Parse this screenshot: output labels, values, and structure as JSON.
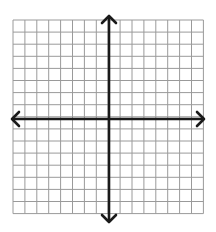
{
  "diagram": {
    "type": "coordinate-plane",
    "grid": {
      "columns": 16,
      "rows": 16,
      "left": 13,
      "top": 20,
      "cell_width": 11.9,
      "cell_height": 12.1,
      "line_color": "#9a9a9a"
    },
    "axes": {
      "color": "#1a1a1a",
      "x_axis": {
        "y": 119,
        "x_start": 12,
        "x_end": 204,
        "arrows": [
          "left",
          "right"
        ]
      },
      "y_axis": {
        "x": 109,
        "y_start": 16,
        "y_end": 222,
        "arrows": [
          "up",
          "down"
        ]
      }
    },
    "background": "#ffffff"
  }
}
